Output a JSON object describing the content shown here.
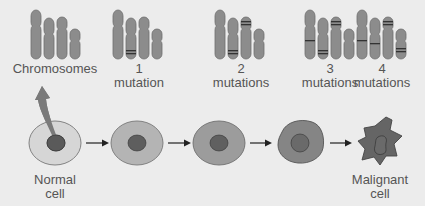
{
  "diagram": {
    "title": "",
    "colors": {
      "background": "#ececec",
      "chromosome": "#8c8c8c",
      "chromosome_stroke": "#6e6e6e",
      "band": "#333333",
      "text": "#555555",
      "arrow": "#222222",
      "curved_arrow": "#7a7a7a"
    },
    "chromosome_groups": [
      {
        "label_line1": "Chromosomes",
        "label_line2": "",
        "mutations": 0
      },
      {
        "label_line1": "1",
        "label_line2": "mutation",
        "mutations": 1
      },
      {
        "label_line1": "2",
        "label_line2": "mutations",
        "mutations": 2
      },
      {
        "label_line1": "3",
        "label_line2": "mutations",
        "mutations": 3
      },
      {
        "label_line1": "4",
        "label_line2": "mutations",
        "mutations": 4
      }
    ],
    "cells": [
      {
        "stage": "normal",
        "label_line1": "Normal",
        "label_line2": "cell",
        "cytoplasm": "#d6d6d6",
        "nucleus": "#5a5a5a"
      },
      {
        "stage": "1-mutation",
        "label_line1": "",
        "label_line2": "",
        "cytoplasm": "#b4b4b4",
        "nucleus": "#5e5e5e"
      },
      {
        "stage": "2-mutations",
        "label_line1": "",
        "label_line2": "",
        "cytoplasm": "#9c9c9c",
        "nucleus": "#606060"
      },
      {
        "stage": "3-mutations",
        "label_line1": "",
        "label_line2": "",
        "cytoplasm": "#858585",
        "nucleus": "#6a6a6a"
      },
      {
        "stage": "malignant",
        "label_line1": "Malignant",
        "label_line2": "cell",
        "cytoplasm": "#656565",
        "nucleus": "#6a6a6a"
      }
    ],
    "arrows": [
      {
        "from": "normal",
        "to": "1-mutation"
      },
      {
        "from": "1-mutation",
        "to": "2-mutations"
      },
      {
        "from": "2-mutations",
        "to": "3-mutations"
      },
      {
        "from": "3-mutations",
        "to": "malignant"
      }
    ]
  }
}
